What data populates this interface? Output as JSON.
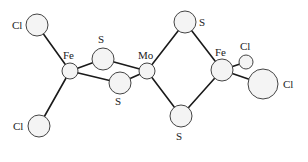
{
  "diagram": {
    "type": "molecular-structure",
    "colors": {
      "bond": "#1a1a1a",
      "atom_fill": "#f4f4f4",
      "atom_stroke": "#444444",
      "label": "#222222"
    },
    "atoms": [
      {
        "id": "cl1",
        "element": "Cl",
        "x": 37,
        "y": 25,
        "r": 11,
        "label": "Cl",
        "lx": 12,
        "ly": 29
      },
      {
        "id": "cl2",
        "element": "Cl",
        "x": 39,
        "y": 126,
        "r": 11,
        "label": "Cl",
        "lx": 13,
        "ly": 130
      },
      {
        "id": "fe1",
        "element": "Fe",
        "x": 70,
        "y": 71,
        "r": 8,
        "label": "Fe",
        "lx": 63,
        "ly": 59
      },
      {
        "id": "s1",
        "element": "S",
        "x": 103,
        "y": 59,
        "r": 11,
        "label": "S",
        "lx": 98,
        "ly": 43
      },
      {
        "id": "s2",
        "element": "S",
        "x": 120,
        "y": 83,
        "r": 11,
        "label": "S",
        "lx": 115,
        "ly": 105
      },
      {
        "id": "mo",
        "element": "Mo",
        "x": 147,
        "y": 71,
        "r": 8,
        "label": "Mo",
        "lx": 138,
        "ly": 59
      },
      {
        "id": "s3",
        "element": "S",
        "x": 185,
        "y": 22,
        "r": 11,
        "label": "S",
        "lx": 199,
        "ly": 26
      },
      {
        "id": "s4",
        "element": "S",
        "x": 181,
        "y": 116,
        "r": 11,
        "label": "S",
        "lx": 176,
        "ly": 140
      },
      {
        "id": "fe2",
        "element": "Fe",
        "x": 222,
        "y": 70,
        "r": 11,
        "label": "Fe",
        "lx": 215,
        "ly": 56
      },
      {
        "id": "cl3",
        "element": "Cl",
        "x": 246,
        "y": 62,
        "r": 7,
        "label": "Cl",
        "lx": 240,
        "ly": 50
      },
      {
        "id": "cl4",
        "element": "Cl",
        "x": 263,
        "y": 84,
        "r": 15,
        "label": "Cl",
        "lx": 283,
        "ly": 88
      }
    ],
    "bonds": [
      [
        "cl1",
        "fe1"
      ],
      [
        "cl2",
        "fe1"
      ],
      [
        "fe1",
        "s1"
      ],
      [
        "fe1",
        "s2"
      ],
      [
        "s1",
        "mo"
      ],
      [
        "s2",
        "mo"
      ],
      [
        "mo",
        "s3"
      ],
      [
        "mo",
        "s4"
      ],
      [
        "s3",
        "fe2"
      ],
      [
        "s4",
        "fe2"
      ],
      [
        "fe2",
        "cl3"
      ],
      [
        "fe2",
        "cl4"
      ]
    ]
  }
}
